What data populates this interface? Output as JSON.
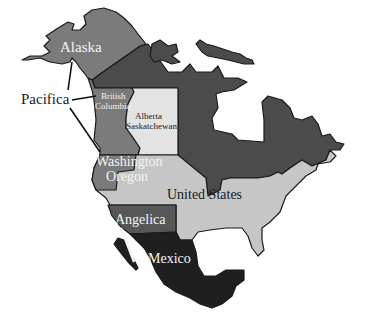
{
  "map": {
    "title": "",
    "colors": {
      "background": "#ffffff",
      "alaska": "#7b7b7b",
      "canada_north": "#4b4b4b",
      "british_columbia": "#7b7b7b",
      "alberta_saskatchewan": "#e3e3e3",
      "washington_oregon": "#7b7b7b",
      "united_states": "#c6c6c6",
      "angelica": "#575757",
      "mexico": "#1f1f1f",
      "border": "#1a1a1a"
    },
    "regions": [
      {
        "id": "alaska",
        "label": "Alaska"
      },
      {
        "id": "canada_north",
        "label": ""
      },
      {
        "id": "british_columbia",
        "label_lines": [
          "British",
          "Columbia"
        ]
      },
      {
        "id": "alberta_saskatchewan",
        "label_lines": [
          "Alberta",
          "Saskatchewan"
        ]
      },
      {
        "id": "washington_oregon",
        "label_lines": [
          "Washington",
          "Oregon"
        ]
      },
      {
        "id": "united_states",
        "label": "United States"
      },
      {
        "id": "angelica",
        "label": "Angelica"
      },
      {
        "id": "mexico",
        "label": "Mexico"
      }
    ],
    "labels": {
      "alaska": "Alaska",
      "bc_line1": "British",
      "bc_line2": "Columbia",
      "ab_line1": "Alberta",
      "ab_line2": "Saskatchewan",
      "wa_line1": "Washington",
      "wa_line2": "Oregon",
      "united_states": "United States",
      "angelica": "Angelica",
      "mexico": "Mexico",
      "pacifica": "Pacifica"
    },
    "callouts": [
      {
        "label": "Pacifica",
        "points_to": [
          "Alaska",
          "British Columbia",
          "Washington Oregon"
        ]
      }
    ]
  }
}
